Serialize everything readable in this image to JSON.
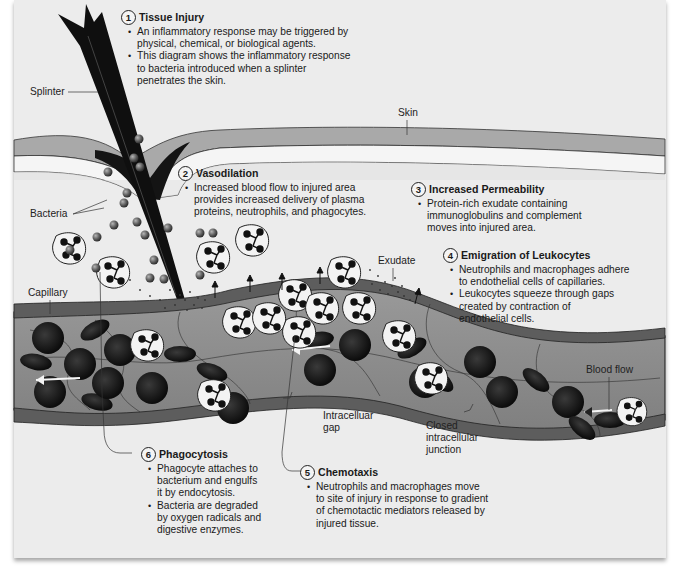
{
  "figure": {
    "palette": {
      "panel_bg": "#ececec",
      "skin_top": "#a9a9a9",
      "skin_mid": "#f4f4f4",
      "dermis": "#dcdcdc",
      "splinter": "#111111",
      "capillary_wall": "#5b5b5b",
      "capillary_lumen": "#8f8f8f",
      "rbc": "#161616",
      "leukocyte": "#f2f2f2",
      "bacteria": "#6a6a6a"
    }
  },
  "labels": {
    "splinter": "Splinter",
    "skin": "Skin",
    "bacteria": "Bacteria",
    "capillary": "Capillary",
    "exudate": "Exudate",
    "blood_flow": "Blood flow",
    "intracellular_gap": "Intracelluar\ngap",
    "closed_junction": "Closed\nintracellular\njunction"
  },
  "steps": [
    {
      "number": "1",
      "title": "Tissue Injury",
      "bullets": [
        "An inflammatory response may be triggered by\nphysical, chemical, or biological agents.",
        "This diagram shows the inflammatory response\nto bacteria introduced when a splinter\npenetrates the skin."
      ]
    },
    {
      "number": "2",
      "title": "Vasodilation",
      "bullets": [
        "Increased blood flow to injured area\nprovides increased delivery of plasma\nproteins, neutrophils, and phagocytes."
      ]
    },
    {
      "number": "3",
      "title": "Increased Permeability",
      "bullets": [
        "Protein-rich exudate containing\nimmunoglobulins and complement\nmoves into injured area."
      ]
    },
    {
      "number": "4",
      "title": "Emigration of Leukocytes",
      "bullets": [
        "Neutrophils and macrophages adhere\nto endothelial cells of capillaries.",
        "Leukocytes squeeze through gaps\ncreated by contraction of\nendothelial cells."
      ]
    },
    {
      "number": "5",
      "title": "Chemotaxis",
      "bullets": [
        "Neutrophils and macrophages move\nto site of injury in response to gradient\nof chemotactic mediators released by\ninjured tissue."
      ]
    },
    {
      "number": "6",
      "title": "Phagocytosis",
      "bullets": [
        "Phagocyte attaches to\nbacterium and engulfs\nit by endocytosis.",
        "Bacteria are degraded\nby oxygen radicals and\ndigestive enzymes."
      ]
    }
  ]
}
